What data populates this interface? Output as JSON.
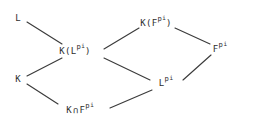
{
  "figure": {
    "kind": "lattice-diagram",
    "width": 255,
    "height": 129,
    "background_color": "#ffffff",
    "text_color": "#2e2e2e",
    "edge_color": "#3b3b3b"
  },
  "nodes": [
    {
      "id": "L",
      "base": "L",
      "sup1": "",
      "sup2": "",
      "suffix": "",
      "x": 18,
      "y": 18
    },
    {
      "id": "KF-pi",
      "base": "K(F",
      "sup1": "p",
      "sup2": "i",
      "suffix": ")",
      "x": 156,
      "y": 23
    },
    {
      "id": "KL-pi",
      "base": "K(L",
      "sup1": "p",
      "sup2": "i",
      "suffix": ")",
      "x": 75,
      "y": 51
    },
    {
      "id": "F-pi",
      "base": "F",
      "sup1": "p",
      "sup2": "i",
      "suffix": "",
      "x": 220,
      "y": 49
    },
    {
      "id": "K",
      "base": "K",
      "sup1": "",
      "sup2": "",
      "suffix": "",
      "x": 18,
      "y": 79
    },
    {
      "id": "L-pi",
      "base": "L",
      "sup1": "p",
      "sup2": "i",
      "suffix": "",
      "x": 166,
      "y": 83
    },
    {
      "id": "K-cap-F-pi",
      "base": "K",
      "cap": "∩",
      "base2": "F",
      "sup1": "p",
      "sup2": "i",
      "suffix": "",
      "x": 80,
      "y": 110
    }
  ],
  "edges": [
    {
      "from": "L",
      "to": "KL-pi",
      "x1": 27,
      "y1": 22,
      "x2": 62,
      "y2": 44
    },
    {
      "from": "KL-pi",
      "to": "KF-pi",
      "x1": 104,
      "y1": 49,
      "x2": 139,
      "y2": 28
    },
    {
      "from": "KF-pi",
      "to": "F-pi",
      "x1": 175,
      "y1": 28,
      "x2": 210,
      "y2": 44
    },
    {
      "from": "K",
      "to": "KL-pi",
      "x1": 27,
      "y1": 76,
      "x2": 62,
      "y2": 58
    },
    {
      "from": "KL-pi",
      "to": "L-pi",
      "x1": 104,
      "y1": 58,
      "x2": 150,
      "y2": 80
    },
    {
      "from": "L-pi",
      "to": "F-pi",
      "x1": 183,
      "y1": 80,
      "x2": 211,
      "y2": 55
    },
    {
      "from": "K",
      "to": "K-cap-F-pi",
      "x1": 27,
      "y1": 84,
      "x2": 58,
      "y2": 104
    },
    {
      "from": "K-cap-F-pi",
      "to": "L-pi",
      "x1": 110,
      "y1": 108,
      "x2": 152,
      "y2": 90
    }
  ]
}
